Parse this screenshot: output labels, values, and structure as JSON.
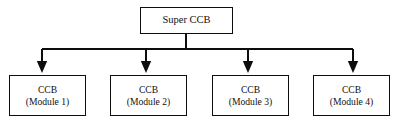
{
  "diagram": {
    "type": "hierarchy-tree",
    "orientation": "top-down",
    "background_color": "#ffffff",
    "stroke_color": "#0d0d0d",
    "text_color": "#111111",
    "root": {
      "label": "Super CCB"
    },
    "children": [
      {
        "title": "CCB",
        "subtitle": "(Module 1)"
      },
      {
        "title": "CCB",
        "subtitle": "(Module 2)"
      },
      {
        "title": "CCB",
        "subtitle": "(Module 3)"
      },
      {
        "title": "CCB",
        "subtitle": "(Module 4)"
      }
    ],
    "connectors": {
      "stem_x": 186,
      "bus_y": 49,
      "bus_x_start": 42,
      "bus_x_end": 353,
      "drop_x": [
        42,
        146,
        248,
        353
      ],
      "arrow_tip_y": 73
    }
  }
}
